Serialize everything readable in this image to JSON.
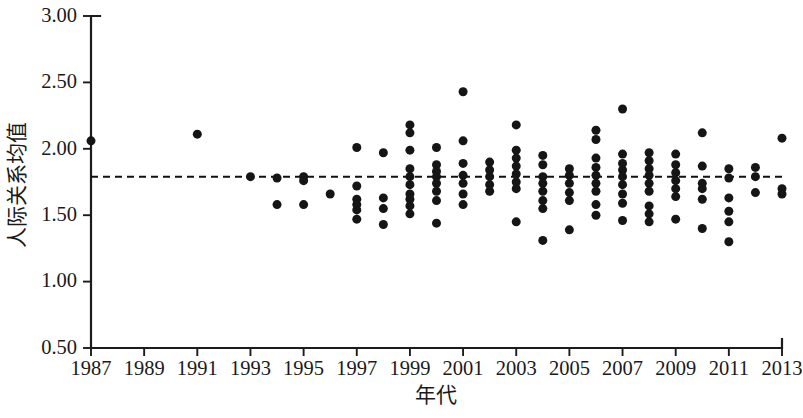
{
  "chart_data": {
    "type": "scatter",
    "title": "",
    "xlabel": "年代",
    "ylabel": "人际关系均值",
    "xlim": [
      1986.5,
      2013.5
    ],
    "ylim": [
      0.5,
      3.0
    ],
    "grid": false,
    "legend": null,
    "xticks": [
      1987,
      1989,
      1991,
      1993,
      1995,
      1997,
      1999,
      2001,
      2003,
      2005,
      2007,
      2009,
      2011,
      2013
    ],
    "xtick_labels": [
      "1987",
      "1989",
      "1991",
      "1993",
      "1995",
      "1997",
      "1999",
      "2001",
      "2003",
      "2005",
      "2007",
      "2009",
      "2011",
      "2013"
    ],
    "yticks": [
      0.5,
      1.0,
      1.5,
      2.0,
      2.5,
      3.0
    ],
    "ytick_labels": [
      "0.50",
      "1.00",
      "1.50",
      "2.00",
      "2.50",
      "3.00"
    ],
    "reference_line": {
      "orientation": "horizontal",
      "value": 1.79,
      "style": "dashed",
      "color": "#111111",
      "label": ""
    },
    "marker": {
      "shape": "circle",
      "color": "#151515",
      "size_px": 9
    },
    "points": [
      {
        "x": 1987,
        "y": 2.06
      },
      {
        "x": 1991,
        "y": 2.11
      },
      {
        "x": 1993,
        "y": 1.79
      },
      {
        "x": 1994,
        "y": 1.78
      },
      {
        "x": 1994,
        "y": 1.58
      },
      {
        "x": 1995,
        "y": 1.79
      },
      {
        "x": 1995,
        "y": 1.76
      },
      {
        "x": 1995,
        "y": 1.58
      },
      {
        "x": 1996,
        "y": 1.66
      },
      {
        "x": 1997,
        "y": 2.01
      },
      {
        "x": 1997,
        "y": 1.72
      },
      {
        "x": 1997,
        "y": 1.62
      },
      {
        "x": 1997,
        "y": 1.58
      },
      {
        "x": 1997,
        "y": 1.54
      },
      {
        "x": 1997,
        "y": 1.47
      },
      {
        "x": 1998,
        "y": 1.97
      },
      {
        "x": 1998,
        "y": 1.63
      },
      {
        "x": 1998,
        "y": 1.55
      },
      {
        "x": 1998,
        "y": 1.43
      },
      {
        "x": 1999,
        "y": 2.18
      },
      {
        "x": 1999,
        "y": 2.12
      },
      {
        "x": 1999,
        "y": 1.99
      },
      {
        "x": 1999,
        "y": 1.85
      },
      {
        "x": 1999,
        "y": 1.79
      },
      {
        "x": 1999,
        "y": 1.73
      },
      {
        "x": 1999,
        "y": 1.66
      },
      {
        "x": 1999,
        "y": 1.62
      },
      {
        "x": 1999,
        "y": 1.57
      },
      {
        "x": 1999,
        "y": 1.51
      },
      {
        "x": 2000,
        "y": 2.01
      },
      {
        "x": 2000,
        "y": 1.88
      },
      {
        "x": 2000,
        "y": 1.83
      },
      {
        "x": 2000,
        "y": 1.79
      },
      {
        "x": 2000,
        "y": 1.74
      },
      {
        "x": 2000,
        "y": 1.68
      },
      {
        "x": 2000,
        "y": 1.61
      },
      {
        "x": 2000,
        "y": 1.44
      },
      {
        "x": 2001,
        "y": 2.43
      },
      {
        "x": 2001,
        "y": 2.06
      },
      {
        "x": 2001,
        "y": 1.89
      },
      {
        "x": 2001,
        "y": 1.8
      },
      {
        "x": 2001,
        "y": 1.74
      },
      {
        "x": 2001,
        "y": 1.66
      },
      {
        "x": 2001,
        "y": 1.58
      },
      {
        "x": 2002,
        "y": 1.9
      },
      {
        "x": 2002,
        "y": 1.84
      },
      {
        "x": 2002,
        "y": 1.79
      },
      {
        "x": 2002,
        "y": 1.73
      },
      {
        "x": 2002,
        "y": 1.68
      },
      {
        "x": 2003,
        "y": 2.18
      },
      {
        "x": 2003,
        "y": 1.99
      },
      {
        "x": 2003,
        "y": 1.93
      },
      {
        "x": 2003,
        "y": 1.87
      },
      {
        "x": 2003,
        "y": 1.81
      },
      {
        "x": 2003,
        "y": 1.75
      },
      {
        "x": 2003,
        "y": 1.7
      },
      {
        "x": 2003,
        "y": 1.45
      },
      {
        "x": 2004,
        "y": 1.95
      },
      {
        "x": 2004,
        "y": 1.88
      },
      {
        "x": 2004,
        "y": 1.79
      },
      {
        "x": 2004,
        "y": 1.74
      },
      {
        "x": 2004,
        "y": 1.68
      },
      {
        "x": 2004,
        "y": 1.61
      },
      {
        "x": 2004,
        "y": 1.55
      },
      {
        "x": 2004,
        "y": 1.31
      },
      {
        "x": 2005,
        "y": 1.85
      },
      {
        "x": 2005,
        "y": 1.8
      },
      {
        "x": 2005,
        "y": 1.74
      },
      {
        "x": 2005,
        "y": 1.67
      },
      {
        "x": 2005,
        "y": 1.61
      },
      {
        "x": 2005,
        "y": 1.39
      },
      {
        "x": 2006,
        "y": 2.14
      },
      {
        "x": 2006,
        "y": 2.07
      },
      {
        "x": 2006,
        "y": 1.93
      },
      {
        "x": 2006,
        "y": 1.86
      },
      {
        "x": 2006,
        "y": 1.8
      },
      {
        "x": 2006,
        "y": 1.74
      },
      {
        "x": 2006,
        "y": 1.68
      },
      {
        "x": 2006,
        "y": 1.58
      },
      {
        "x": 2006,
        "y": 1.5
      },
      {
        "x": 2007,
        "y": 2.3
      },
      {
        "x": 2007,
        "y": 1.96
      },
      {
        "x": 2007,
        "y": 1.89
      },
      {
        "x": 2007,
        "y": 1.84
      },
      {
        "x": 2007,
        "y": 1.79
      },
      {
        "x": 2007,
        "y": 1.73
      },
      {
        "x": 2007,
        "y": 1.66
      },
      {
        "x": 2007,
        "y": 1.59
      },
      {
        "x": 2007,
        "y": 1.46
      },
      {
        "x": 2008,
        "y": 1.97
      },
      {
        "x": 2008,
        "y": 1.91
      },
      {
        "x": 2008,
        "y": 1.85
      },
      {
        "x": 2008,
        "y": 1.8
      },
      {
        "x": 2008,
        "y": 1.74
      },
      {
        "x": 2008,
        "y": 1.68
      },
      {
        "x": 2008,
        "y": 1.57
      },
      {
        "x": 2008,
        "y": 1.51
      },
      {
        "x": 2008,
        "y": 1.45
      },
      {
        "x": 2009,
        "y": 1.96
      },
      {
        "x": 2009,
        "y": 1.88
      },
      {
        "x": 2009,
        "y": 1.82
      },
      {
        "x": 2009,
        "y": 1.76
      },
      {
        "x": 2009,
        "y": 1.7
      },
      {
        "x": 2009,
        "y": 1.64
      },
      {
        "x": 2009,
        "y": 1.47
      },
      {
        "x": 2010,
        "y": 2.12
      },
      {
        "x": 2010,
        "y": 1.87
      },
      {
        "x": 2010,
        "y": 1.74
      },
      {
        "x": 2010,
        "y": 1.7
      },
      {
        "x": 2010,
        "y": 1.62
      },
      {
        "x": 2010,
        "y": 1.4
      },
      {
        "x": 2011,
        "y": 1.85
      },
      {
        "x": 2011,
        "y": 1.78
      },
      {
        "x": 2011,
        "y": 1.63
      },
      {
        "x": 2011,
        "y": 1.53
      },
      {
        "x": 2011,
        "y": 1.45
      },
      {
        "x": 2011,
        "y": 1.3
      },
      {
        "x": 2012,
        "y": 1.86
      },
      {
        "x": 2012,
        "y": 1.79
      },
      {
        "x": 2012,
        "y": 1.67
      },
      {
        "x": 2013,
        "y": 2.08
      },
      {
        "x": 2013,
        "y": 1.7
      },
      {
        "x": 2013,
        "y": 1.66
      }
    ]
  },
  "figure": {
    "background_color": "#ffffff",
    "axis_color": "#1c1c1c"
  }
}
